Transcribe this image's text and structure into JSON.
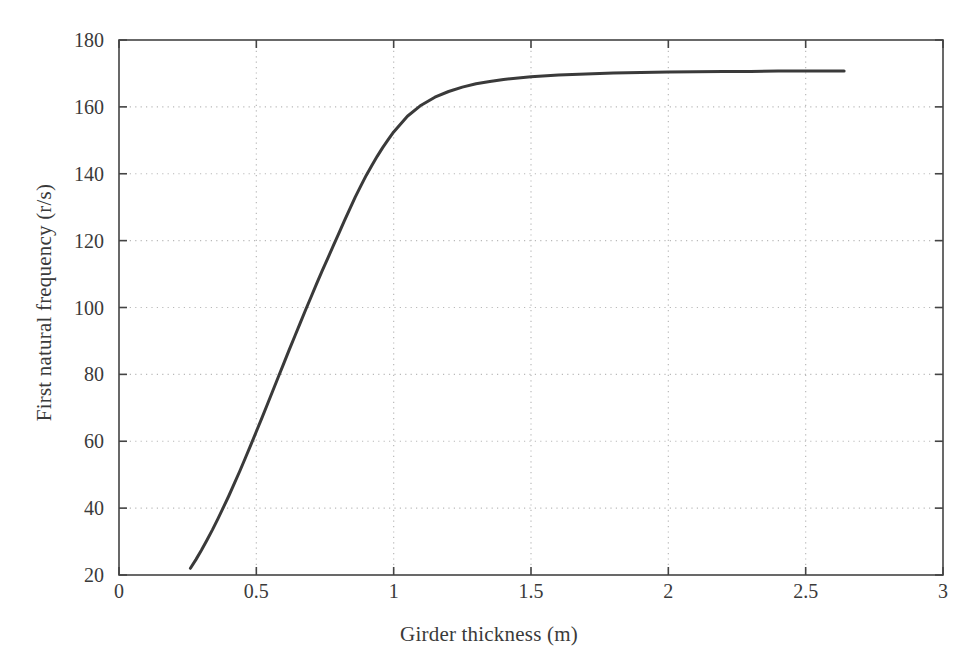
{
  "chart_data": {
    "type": "line",
    "title": "",
    "xlabel": "Girder thickness (m)",
    "ylabel": "First natural frequency (r/s)",
    "xlim": [
      0,
      3
    ],
    "ylim": [
      20,
      180
    ],
    "xticks": [
      0,
      0.5,
      1,
      1.5,
      2,
      2.5,
      3
    ],
    "xticklabels": [
      "0",
      "0.5",
      "1",
      "1.5",
      "2",
      "2.5",
      "3"
    ],
    "yticks": [
      20,
      40,
      60,
      80,
      100,
      120,
      140,
      160,
      180
    ],
    "yticklabels": [
      "20",
      "40",
      "60",
      "80",
      "100",
      "120",
      "140",
      "160",
      "180"
    ],
    "grid": true,
    "grid_style": "dotted",
    "grid_color": "#b9b9b9",
    "legend": null,
    "line_color": "#3a3a3a",
    "line_width": 3.0,
    "series": [
      {
        "name": "First natural frequency",
        "x": [
          0.26,
          0.28,
          0.3,
          0.32,
          0.34,
          0.36,
          0.38,
          0.4,
          0.42,
          0.44,
          0.46,
          0.48,
          0.5,
          0.52,
          0.54,
          0.56,
          0.58,
          0.6,
          0.62,
          0.64,
          0.66,
          0.68,
          0.7,
          0.72,
          0.74,
          0.76,
          0.78,
          0.8,
          0.82,
          0.84,
          0.86,
          0.88,
          0.9,
          0.92,
          0.94,
          0.96,
          0.98,
          1.0,
          1.05,
          1.1,
          1.15,
          1.2,
          1.25,
          1.3,
          1.35,
          1.4,
          1.5,
          1.6,
          1.7,
          1.8,
          1.9,
          2.0,
          2.1,
          2.2,
          2.3,
          2.4,
          2.5,
          2.64
        ],
        "y": [
          22.0,
          24.6,
          27.4,
          30.4,
          33.5,
          36.8,
          40.2,
          43.7,
          47.4,
          51.1,
          55.0,
          58.9,
          62.9,
          66.9,
          71.0,
          75.1,
          79.2,
          83.3,
          87.4,
          91.4,
          95.4,
          99.4,
          103.3,
          107.2,
          111.0,
          114.7,
          118.4,
          122.1,
          125.8,
          129.4,
          133.0,
          136.3,
          139.5,
          142.4,
          145.2,
          147.8,
          150.2,
          152.5,
          157.2,
          160.5,
          162.9,
          164.6,
          165.9,
          166.9,
          167.6,
          168.2,
          169.0,
          169.5,
          169.8,
          170.1,
          170.3,
          170.4,
          170.5,
          170.6,
          170.6,
          170.7,
          170.7,
          170.7
        ]
      }
    ]
  }
}
